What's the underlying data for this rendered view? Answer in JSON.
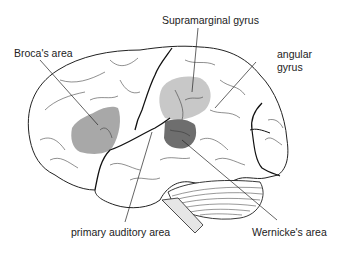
{
  "diagram": {
    "labels": {
      "supramarginal": "Supramarginal gyrus",
      "broca": "Broca's area",
      "angular_line1": "angular",
      "angular_line2": "gyrus",
      "auditory": "primary auditory area",
      "wernicke": "Wernicke's area"
    },
    "colors": {
      "outline": "#222222",
      "broca_fill": "#a8a8a8",
      "supramarginal_fill": "#c8c8c8",
      "wernicke_fill": "#6e6e6e",
      "brainstem_fill": "#e6e6e6"
    }
  }
}
